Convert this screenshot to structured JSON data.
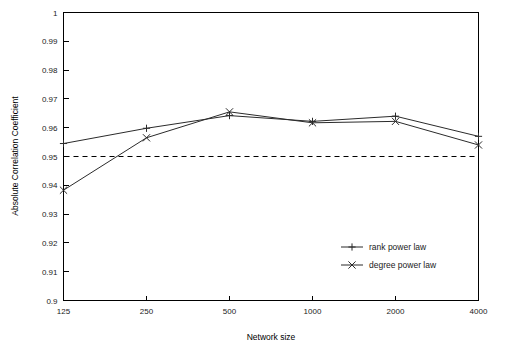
{
  "chart_data": {
    "type": "line",
    "title": "",
    "xlabel": "Network size",
    "ylabel": "Absolute Correlation Coefficient",
    "x_categories": [
      "125",
      "250",
      "500",
      "1000",
      "2000",
      "4000"
    ],
    "y_ticks": [
      "0.9",
      "0.91",
      "0.92",
      "0.93",
      "0.94",
      "0.95",
      "0.96",
      "0.97",
      "0.98",
      "0.99",
      "1"
    ],
    "ylim": [
      0.9,
      1.0
    ],
    "grid": false,
    "legend_position": "bottom-right",
    "annotations": [
      {
        "name": "threshold",
        "type": "hline",
        "value": 0.95,
        "style": "dashed"
      }
    ],
    "series": [
      {
        "name": "rank power law",
        "marker": "plus",
        "values": [
          0.9545,
          0.9598,
          0.9642,
          0.9622,
          0.964,
          0.957
        ]
      },
      {
        "name": "degree power law",
        "marker": "cross",
        "values": [
          0.9383,
          0.9565,
          0.9655,
          0.9617,
          0.9622,
          0.954
        ]
      }
    ]
  },
  "legend": {
    "items": [
      {
        "label": "rank power law",
        "marker": "plus"
      },
      {
        "label": "degree power law",
        "marker": "cross"
      }
    ]
  },
  "axes": {
    "x_label": "Network size",
    "y_label": "Absolute Correlation Coefficient",
    "x_tick_labels": [
      "125",
      "250",
      "500",
      "1000",
      "2000",
      "4000"
    ],
    "y_tick_labels": [
      "1",
      "0.99",
      "0.98",
      "0.97",
      "0.96",
      "0.95",
      "0.94",
      "0.93",
      "0.92",
      "0.91",
      "0.9"
    ]
  }
}
